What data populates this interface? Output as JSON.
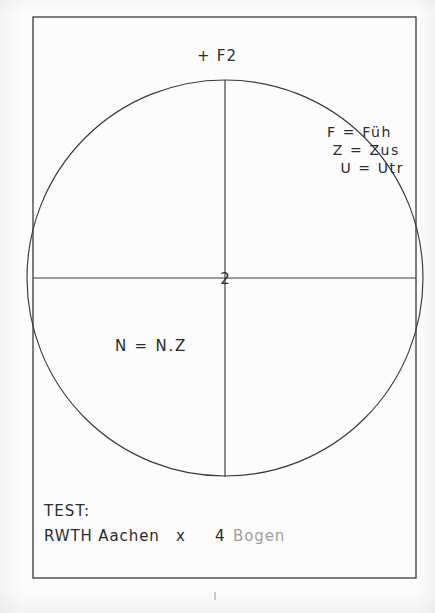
{
  "document": {
    "kind": "pen-plotter-test-sheet",
    "background_color": "#fcfcfc",
    "ink_color": "#2b2b2b"
  },
  "frame": {
    "left": 33,
    "top": 17,
    "right": 416,
    "bottom": 578
  },
  "circle": {
    "center_x": 225,
    "center_y": 278,
    "radius": 198
  },
  "axes": {
    "horizontal": {
      "x1": 33,
      "y1": 278,
      "x2": 416,
      "y2": 278
    },
    "vertical": {
      "x1": 225,
      "y1": 80,
      "x2": 225,
      "y2": 477
    }
  },
  "origin_marker": {
    "label": "2",
    "x": 225,
    "y": 278
  },
  "labels": {
    "top_marker": "+  F2",
    "quadrant_note": "N = N.Z"
  },
  "legend": {
    "lines": [
      "F = Füh",
      "Z = Zus",
      "U = Utr"
    ]
  },
  "footer": {
    "title": "TEST:",
    "institution": "RWTH Aachen",
    "separator": "x",
    "quantity": "4",
    "unit": "Bogen"
  },
  "registration_mark": {
    "x": 215,
    "y": 596
  }
}
